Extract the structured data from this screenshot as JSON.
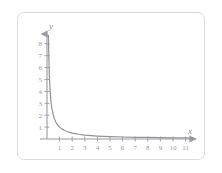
{
  "figure": {
    "card_border_color": "#dcdcdc",
    "background_color": "#ffffff",
    "axis_color": "#9a9aa2",
    "curve_color": "#8f9298",
    "tick_label_color": "#9a9aa2"
  },
  "axes": {
    "x_axis_label": "x",
    "y_axis_label": "y",
    "x_ticks": [
      "1",
      "2",
      "3",
      "4",
      "5",
      "6",
      "7",
      "8",
      "9",
      "10",
      "11"
    ],
    "y_ticks": [
      "1",
      "2",
      "3",
      "4",
      "5",
      "6",
      "7",
      "8"
    ]
  },
  "chart_data": {
    "type": "line",
    "title": "",
    "subtitle": "",
    "xlabel": "x",
    "ylabel": "y",
    "xlim": [
      0,
      11.8
    ],
    "ylim": [
      0,
      8.8
    ],
    "grid": false,
    "legend": null,
    "annotations": [],
    "xticks": [
      1,
      2,
      3,
      4,
      5,
      6,
      7,
      8,
      9,
      10,
      11
    ],
    "yticks": [
      1,
      2,
      3,
      4,
      5,
      6,
      7,
      8
    ],
    "series": [
      {
        "name": "y = 1/x",
        "equation": "y = 1/x",
        "x": [
          0.115,
          0.13,
          0.15,
          0.175,
          0.2,
          0.25,
          0.3,
          0.35,
          0.4,
          0.5,
          0.6,
          0.7,
          0.8,
          0.9,
          1.0,
          1.2,
          1.4,
          1.6,
          1.8,
          2.0,
          2.5,
          3.0,
          3.5,
          4.0,
          4.5,
          5.0,
          6.0,
          7.0,
          8.0,
          9.0,
          10.0,
          11.0,
          11.6
        ],
        "y": [
          8.7,
          7.69,
          6.67,
          5.71,
          5.0,
          4.0,
          3.33,
          2.86,
          2.5,
          2.0,
          1.67,
          1.43,
          1.25,
          1.11,
          1.0,
          0.83,
          0.71,
          0.63,
          0.56,
          0.5,
          0.4,
          0.33,
          0.29,
          0.25,
          0.22,
          0.2,
          0.17,
          0.14,
          0.13,
          0.11,
          0.1,
          0.09,
          0.086
        ]
      }
    ]
  }
}
